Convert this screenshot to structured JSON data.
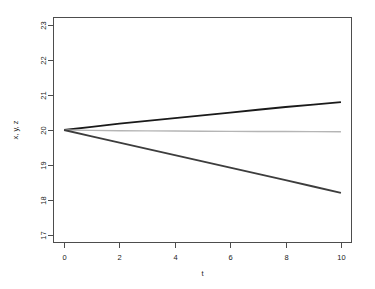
{
  "chart_data": {
    "type": "line",
    "title": "",
    "xlabel": "t",
    "ylabel": "x, y, z",
    "xlim": [
      0,
      10
    ],
    "ylim": [
      17,
      23
    ],
    "grid": false,
    "legend": null,
    "x_ticks": [
      "0",
      "2",
      "4",
      "6",
      "8",
      "10"
    ],
    "x_tick_values": [
      0,
      2,
      4,
      6,
      8,
      10
    ],
    "y_ticks": [
      "17",
      "18",
      "19",
      "20",
      "21",
      "22",
      "23"
    ],
    "y_tick_values": [
      17,
      18,
      19,
      20,
      21,
      22,
      23
    ],
    "x": [
      0,
      1,
      2,
      3,
      4,
      5,
      6,
      7,
      8,
      9,
      10
    ],
    "series": [
      {
        "name": "x",
        "color": "#1a1a1a",
        "width": 1.8,
        "values": [
          20.0,
          20.09,
          20.18,
          20.26,
          20.34,
          20.42,
          20.5,
          20.58,
          20.66,
          20.73,
          20.8
        ]
      },
      {
        "name": "y",
        "color": "#b5b5b5",
        "width": 1.4,
        "values": [
          20.0,
          19.99,
          19.98,
          19.975,
          19.97,
          19.965,
          19.96,
          19.958,
          19.955,
          19.952,
          19.95
        ]
      },
      {
        "name": "z",
        "color": "#3d3d3d",
        "width": 1.8,
        "values": [
          20.0,
          19.82,
          19.64,
          19.46,
          19.28,
          19.1,
          18.92,
          18.74,
          18.56,
          18.38,
          18.2
        ]
      }
    ]
  },
  "plot_box": {
    "left": 53,
    "right": 352,
    "top": 17,
    "bottom": 243
  }
}
